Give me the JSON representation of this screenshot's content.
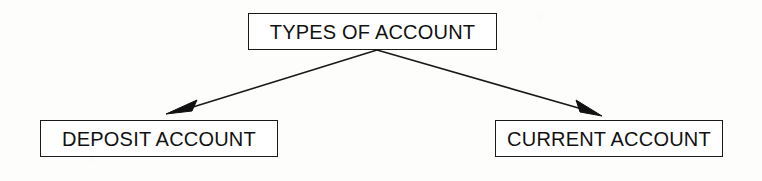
{
  "diagram": {
    "title_text": "TYPES OF ACCOUNT",
    "background_color": "#fdfdfc",
    "stroke_color": "#1a1a1a",
    "text_color": "#111111",
    "nodes": [
      {
        "id": "root",
        "label": "TYPES OF ACCOUNT",
        "x": 248,
        "y": 13,
        "width": 249,
        "height": 37
      },
      {
        "id": "deposit",
        "label": "DEPOSIT ACCOUNT",
        "x": 40,
        "y": 120,
        "width": 238,
        "height": 37
      },
      {
        "id": "current",
        "label": "CURRENT ACCOUNT",
        "x": 495,
        "y": 120,
        "width": 228,
        "height": 37
      }
    ],
    "connectors": [
      {
        "id": "root-to-deposit",
        "from": "root",
        "to": "deposit",
        "arrowhead": "filled-triangle",
        "line": "M 377 50 L 180 111",
        "head": "M 166 114 L 197 100 L 192 111 Z"
      },
      {
        "id": "root-to-current",
        "from": "root",
        "to": "current",
        "arrowhead": "filled-triangle",
        "line": "M 377 50 L 589 111",
        "head": "M 602 116 L 576 100 L 580 112 Z"
      }
    ]
  }
}
